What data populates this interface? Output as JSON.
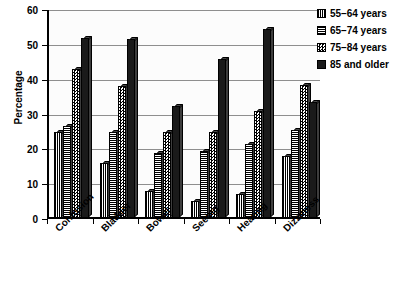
{
  "chart_data": {
    "type": "bar",
    "title": "",
    "subtitle": "",
    "xlabel": "",
    "ylabel": "Percentage",
    "ylim": [
      0,
      60
    ],
    "ytick_values": [
      0,
      10,
      20,
      30,
      40,
      50,
      60
    ],
    "ytick_labels": [
      "0",
      "10",
      "20",
      "30",
      "40",
      "50",
      "60"
    ],
    "grid": true,
    "legend_position": "right",
    "categories": [
      "Confusion",
      "Bladder",
      "Bowel",
      "Seeing",
      "Hearing",
      "Dizziness"
    ],
    "series": [
      {
        "name": "55–64 years",
        "pattern": "vertical-stripes",
        "color": "#ffffff",
        "values": [
          24.5,
          15.5,
          7.5,
          4.5,
          6.5,
          17.5
        ]
      },
      {
        "name": "65–74 years",
        "pattern": "horizontal-stripes",
        "color": "#ffffff",
        "values": [
          26,
          24.5,
          18.5,
          19,
          21,
          25
        ]
      },
      {
        "name": "75–84 years",
        "pattern": "checkerboard",
        "color": "#ffffff",
        "values": [
          42.5,
          37.5,
          24.5,
          24.5,
          30.5,
          38
        ]
      },
      {
        "name": "85 and older",
        "pattern": "solid",
        "color": "#1a1a1a",
        "values": [
          51.5,
          51,
          32,
          45.5,
          54,
          33
        ]
      }
    ]
  },
  "legend": {
    "items": [
      {
        "label": "55–64 years"
      },
      {
        "label": "65–74 years"
      },
      {
        "label": "75–84 years"
      },
      {
        "label": "85 and older"
      }
    ]
  }
}
